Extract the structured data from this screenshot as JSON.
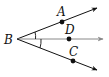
{
  "diagram": {
    "type": "angle-bisector",
    "vertex": {
      "label": "B",
      "x": 17,
      "y": 39,
      "label_x": 4,
      "label_y": 44
    },
    "rays": [
      {
        "name": "BA",
        "end_x": 97,
        "end_y": 8,
        "color": "#111111",
        "point": {
          "label": "A",
          "x": 62,
          "y": 22,
          "label_x": 57,
          "label_y": 16
        }
      },
      {
        "name": "BD",
        "end_x": 103,
        "end_y": 39,
        "color": "#888888",
        "point": {
          "label": "D",
          "x": 69,
          "y": 39,
          "label_x": 65,
          "label_y": 34
        }
      },
      {
        "name": "BC",
        "end_x": 97,
        "end_y": 70,
        "color": "#111111",
        "point": {
          "label": "C",
          "x": 73,
          "y": 61,
          "label_x": 69,
          "label_y": 56
        }
      }
    ],
    "angle_marks": [
      {
        "between": "ABD",
        "description": "single tick arc"
      },
      {
        "between": "DBC",
        "description": "single tick arc"
      }
    ]
  }
}
